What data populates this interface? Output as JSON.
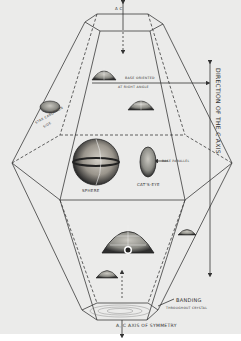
{
  "figure": {
    "colors": {
      "paper": "#ebebea",
      "line": "#3a3a3a",
      "stone_dark": "#2e2e2e",
      "stone_mid": "#8a8a84",
      "stone_light": "#c9c7c0"
    },
    "labels": {
      "top_axis": "A  C",
      "base_oriented_line1": "BASE ORIENTED",
      "base_oriented_line2": "AT RIGHT ANGLE",
      "left_stone_line1": "STAR CABOCHON",
      "left_stone_line2": "SIDE",
      "sphere": "SPHERE",
      "cats_eye": "CAT'S-EYE",
      "base_parallel": "BASE PARALLEL",
      "direction_axis": "DIRECTION OF THE C AXIS",
      "banding_line1": "BANDING",
      "banding_line2": "THROUGHOUT CRYSTAL",
      "axis_of_symmetry": "A, C AXIS OF SYMMETRY"
    },
    "stones": [
      {
        "name": "upper-cabochon",
        "type": "dome"
      },
      {
        "name": "left-cabochon",
        "type": "dome"
      },
      {
        "name": "center-cabochon",
        "type": "dome"
      },
      {
        "name": "sphere",
        "type": "sphere"
      },
      {
        "name": "cats-eye",
        "type": "oval"
      },
      {
        "name": "large-star-cabochon",
        "type": "dome"
      },
      {
        "name": "right-small-cabochon",
        "type": "dome"
      },
      {
        "name": "lower-small-cabochon",
        "type": "dome"
      }
    ]
  }
}
